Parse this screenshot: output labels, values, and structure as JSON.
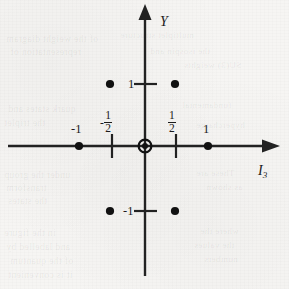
{
  "figure": {
    "kind": "cartesian-point-plot",
    "background_color": "#f6f5f3",
    "ink_color": "#1b1b1b"
  },
  "axes": {
    "x": {
      "name": "I",
      "name_subscript": "3",
      "arrow": "right"
    },
    "y": {
      "name": "Y",
      "arrow": "up"
    }
  },
  "ticks": {
    "x": [
      {
        "label_type": "fraction",
        "sign": "-",
        "numerator": "1",
        "denominator": "2",
        "value": -0.5
      },
      {
        "label_type": "fraction",
        "sign": "",
        "numerator": "1",
        "denominator": "2",
        "value": 0.5
      }
    ],
    "x_plain": [
      {
        "label": "-1",
        "value": -1
      },
      {
        "label": "1",
        "value": 1
      }
    ],
    "y_plain": [
      {
        "label": "1",
        "value": 1
      },
      {
        "label": "-1",
        "value": -1
      }
    ]
  },
  "chart_data": {
    "type": "scatter",
    "title": "",
    "xlabel": "I3",
    "ylabel": "Y",
    "xlim": [
      -1.6,
      1.6
    ],
    "ylim": [
      -1.6,
      1.6
    ],
    "grid": false,
    "legend": "none",
    "xticks": [
      -1,
      -0.5,
      0.5,
      1
    ],
    "xticklabels": [
      "-1",
      "-1/2",
      "1/2",
      "1"
    ],
    "yticks": [
      -1,
      1
    ],
    "yticklabels": [
      "-1",
      "1"
    ],
    "series": [
      {
        "name": "points",
        "marker": "filled-circle",
        "points": [
          {
            "x": -1,
            "y": 0
          },
          {
            "x": 1,
            "y": 0
          },
          {
            "x": -0.5,
            "y": 1
          },
          {
            "x": 0.5,
            "y": 1
          },
          {
            "x": -0.5,
            "y": -1
          },
          {
            "x": 0.5,
            "y": -1
          }
        ]
      },
      {
        "name": "origin",
        "marker": "circled-dot",
        "points": [
          {
            "x": 0,
            "y": 0
          }
        ]
      }
    ]
  },
  "bleed_text": [
    {
      "text": "of the weight diagram",
      "x": 6,
      "y": 34,
      "size": 9.5
    },
    {
      "text": "multiplet structure",
      "x": 120,
      "y": 30,
      "size": 9.0
    },
    {
      "text": "representation of",
      "x": 10,
      "y": 47,
      "size": 9.5
    },
    {
      "text": "the isospin and",
      "x": 150,
      "y": 46,
      "size": 9.0
    },
    {
      "text": "SU(3) weights",
      "x": 184,
      "y": 60,
      "size": 9.0
    },
    {
      "text": "quark states and",
      "x": 8,
      "y": 104,
      "size": 9.5
    },
    {
      "text": "fundamental",
      "x": 182,
      "y": 100,
      "size": 9.0
    },
    {
      "text": "the triplet",
      "x": 4,
      "y": 118,
      "size": 9.5
    },
    {
      "text": "hypercharge",
      "x": 196,
      "y": 120,
      "size": 9.0
    },
    {
      "text": "under the group",
      "x": 4,
      "y": 170,
      "size": 9.5
    },
    {
      "text": "These are",
      "x": 196,
      "y": 168,
      "size": 9.0
    },
    {
      "text": "transform",
      "x": 6,
      "y": 183,
      "size": 9.5
    },
    {
      "text": "as shown",
      "x": 206,
      "y": 182,
      "size": 9.0
    },
    {
      "text": "the states",
      "x": 8,
      "y": 196,
      "size": 9.5
    },
    {
      "text": "in the figure",
      "x": 4,
      "y": 228,
      "size": 9.5
    },
    {
      "text": "where the",
      "x": 200,
      "y": 226,
      "size": 9.0
    },
    {
      "text": "and labelled by",
      "x": 6,
      "y": 242,
      "size": 9.5
    },
    {
      "text": "the values",
      "x": 194,
      "y": 240,
      "size": 9.0
    },
    {
      "text": "of the quantum",
      "x": 10,
      "y": 256,
      "size": 9.5
    },
    {
      "text": "numbers",
      "x": 204,
      "y": 254,
      "size": 9.0
    },
    {
      "text": "it is convenient",
      "x": 8,
      "y": 270,
      "size": 9.5
    }
  ]
}
